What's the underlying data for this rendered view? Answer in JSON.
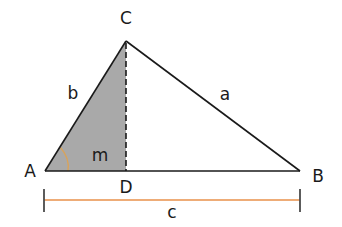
{
  "diagram": {
    "type": "triangle-with-altitude",
    "vertices": {
      "A": {
        "label": "A",
        "x": 45,
        "y": 171
      },
      "B": {
        "label": "B",
        "x": 300,
        "y": 171
      },
      "C": {
        "label": "C",
        "x": 126,
        "y": 41
      },
      "D": {
        "label": "D",
        "x": 126,
        "y": 171
      }
    },
    "sides": {
      "a": {
        "label": "a",
        "from": "C",
        "to": "B"
      },
      "b": {
        "label": "b",
        "from": "A",
        "to": "C"
      },
      "c": {
        "label": "c",
        "from": "A",
        "to": "B"
      }
    },
    "altitude": {
      "from": "C",
      "to": "D",
      "style": "dashed"
    },
    "segment_label": {
      "label": "m",
      "description": "segment AD"
    },
    "shaded_region": "triangle ADC",
    "angle_marker": {
      "at": "A",
      "color": "#d9a35a"
    },
    "dimension_line": {
      "label": "c",
      "color": "#e8904a",
      "from_x": 44,
      "to_x": 300
    }
  },
  "colors": {
    "stroke": "#1a1a1a",
    "shade": "#a9a9a9",
    "dimension": "#e8904a",
    "tick": "#4a4a4a",
    "angle_arc": "#d9a35a"
  }
}
